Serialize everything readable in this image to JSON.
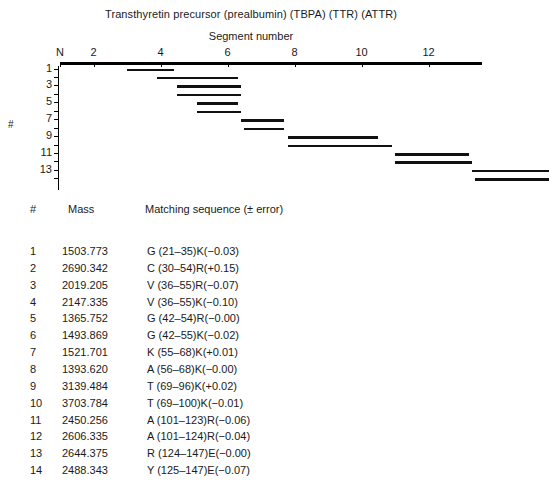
{
  "figure": {
    "title": "Transthyretin precursor (prealbumin) (TBPA) (TTR) (ATTR)",
    "axis_title": "Segment number",
    "y_axis_title": "#"
  },
  "chart_data": {
    "type": "bar",
    "title": "Transthyretin precursor (prealbumin) (TBPA) (TTR) (ATTR)",
    "xlabel": "Segment number",
    "ylabel": "#",
    "orientation": "horizontal-range",
    "grid": false,
    "legend": null,
    "xlim": [
      1,
      13.6
    ],
    "x_tick_labels": [
      "N",
      "2",
      "4",
      "6",
      "8",
      "10",
      "12"
    ],
    "x_tick_values": [
      1,
      2,
      4,
      6,
      8,
      10,
      12
    ],
    "y_tick_labels": [
      "1",
      "3",
      "5",
      "7",
      "9",
      "11",
      "13"
    ],
    "y_tick_values": [
      1,
      3,
      5,
      7,
      9,
      11,
      13
    ],
    "residues_per_segment": 10,
    "bars": [
      {
        "index": 1,
        "start_residue": 21,
        "end_residue": 35
      },
      {
        "index": 2,
        "start_residue": 30,
        "end_residue": 54
      },
      {
        "index": 3,
        "start_residue": 36,
        "end_residue": 55
      },
      {
        "index": 4,
        "start_residue": 36,
        "end_residue": 55
      },
      {
        "index": 5,
        "start_residue": 42,
        "end_residue": 54
      },
      {
        "index": 6,
        "start_residue": 42,
        "end_residue": 55
      },
      {
        "index": 7,
        "start_residue": 55,
        "end_residue": 68
      },
      {
        "index": 8,
        "start_residue": 56,
        "end_residue": 68
      },
      {
        "index": 9,
        "start_residue": 69,
        "end_residue": 96
      },
      {
        "index": 10,
        "start_residue": 69,
        "end_residue": 100
      },
      {
        "index": 11,
        "start_residue": 101,
        "end_residue": 123
      },
      {
        "index": 12,
        "start_residue": 101,
        "end_residue": 124
      },
      {
        "index": 13,
        "start_residue": 124,
        "end_residue": 147
      },
      {
        "index": 14,
        "start_residue": 125,
        "end_residue": 147
      }
    ]
  },
  "table": {
    "headers": {
      "number": "#",
      "mass": "Mass",
      "sequence": "Matching sequence (± error)"
    },
    "rows": [
      {
        "num": "1",
        "mass": "1503.773",
        "seq": "G (21–35)K(−0.03)"
      },
      {
        "num": "2",
        "mass": "2690.342",
        "seq": "C (30–54)R(+0.15)"
      },
      {
        "num": "3",
        "mass": "2019.205",
        "seq": "V (36–55)R(−0.07)"
      },
      {
        "num": "4",
        "mass": "2147.335",
        "seq": "V (36–55)K(−0.10)"
      },
      {
        "num": "5",
        "mass": "1365.752",
        "seq": "G (42–54)R(−0.00)"
      },
      {
        "num": "6",
        "mass": "1493.869",
        "seq": "G (42–55)K(−0.02)"
      },
      {
        "num": "7",
        "mass": "1521.701",
        "seq": "K (55–68)K(+0.01)"
      },
      {
        "num": "8",
        "mass": "1393.620",
        "seq": "A (56–68)K(−0.00)"
      },
      {
        "num": "9",
        "mass": "3139.484",
        "seq": "T (69–96)K(+0.02)"
      },
      {
        "num": "10",
        "mass": "3703.784",
        "seq": "T (69–100)K(−0.01)"
      },
      {
        "num": "11",
        "mass": "2450.256",
        "seq": "A (101–123)R(−0.06)"
      },
      {
        "num": "12",
        "mass": "2606.335",
        "seq": "A (101–124)R(−0.04)"
      },
      {
        "num": "13",
        "mass": "2644.375",
        "seq": "R (124–147)E(−0.00)"
      },
      {
        "num": "14",
        "mass": "2488.343",
        "seq": "Y (125–147)E(−0.07)"
      }
    ]
  }
}
